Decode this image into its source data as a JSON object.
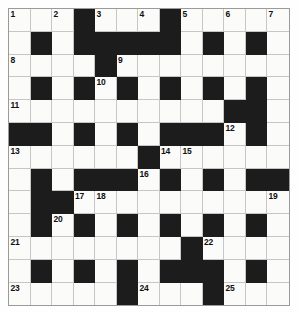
{
  "puzzle": {
    "title": "Crossword Grid",
    "rows": 13,
    "cols": 13,
    "cell_size_px": 21.5,
    "colors": {
      "blocked": "#1c1c1c",
      "open": "#fbfbfa",
      "gridline": "#c6c6c6",
      "border": "#9a9a9a",
      "number_text": "#101010",
      "page_background": "#ffffff"
    },
    "blocked_cells": [
      [
        0,
        3
      ],
      [
        0,
        7
      ],
      [
        1,
        1
      ],
      [
        1,
        3
      ],
      [
        1,
        4
      ],
      [
        1,
        5
      ],
      [
        1,
        6
      ],
      [
        1,
        7
      ],
      [
        1,
        9
      ],
      [
        1,
        11
      ],
      [
        2,
        4
      ],
      [
        3,
        1
      ],
      [
        3,
        3
      ],
      [
        3,
        5
      ],
      [
        3,
        7
      ],
      [
        3,
        9
      ],
      [
        3,
        11
      ],
      [
        4,
        10
      ],
      [
        4,
        11
      ],
      [
        5,
        0
      ],
      [
        5,
        1
      ],
      [
        5,
        3
      ],
      [
        5,
        5
      ],
      [
        5,
        7
      ],
      [
        5,
        8
      ],
      [
        5,
        9
      ],
      [
        5,
        11
      ],
      [
        6,
        6
      ],
      [
        7,
        1
      ],
      [
        7,
        3
      ],
      [
        7,
        4
      ],
      [
        7,
        5
      ],
      [
        7,
        7
      ],
      [
        7,
        9
      ],
      [
        7,
        11
      ],
      [
        7,
        12
      ],
      [
        8,
        1
      ],
      [
        8,
        2
      ],
      [
        9,
        1
      ],
      [
        9,
        3
      ],
      [
        9,
        5
      ],
      [
        9,
        7
      ],
      [
        9,
        9
      ],
      [
        9,
        11
      ],
      [
        10,
        8
      ],
      [
        11,
        1
      ],
      [
        11,
        3
      ],
      [
        11,
        5
      ],
      [
        11,
        7
      ],
      [
        11,
        8
      ],
      [
        11,
        9
      ],
      [
        11,
        11
      ],
      [
        12,
        5
      ],
      [
        12,
        9
      ]
    ],
    "numbers": [
      {
        "n": 1,
        "row": 0,
        "col": 0
      },
      {
        "n": 2,
        "row": 0,
        "col": 2
      },
      {
        "n": 3,
        "row": 0,
        "col": 4
      },
      {
        "n": 4,
        "row": 0,
        "col": 6
      },
      {
        "n": 5,
        "row": 0,
        "col": 8
      },
      {
        "n": 6,
        "row": 0,
        "col": 10
      },
      {
        "n": 7,
        "row": 0,
        "col": 12
      },
      {
        "n": 8,
        "row": 2,
        "col": 0
      },
      {
        "n": 9,
        "row": 2,
        "col": 5
      },
      {
        "n": 10,
        "row": 3,
        "col": 4
      },
      {
        "n": 11,
        "row": 4,
        "col": 0
      },
      {
        "n": 12,
        "row": 5,
        "col": 10
      },
      {
        "n": 13,
        "row": 6,
        "col": 0
      },
      {
        "n": 14,
        "row": 6,
        "col": 7
      },
      {
        "n": 15,
        "row": 6,
        "col": 8
      },
      {
        "n": 16,
        "row": 7,
        "col": 6
      },
      {
        "n": 17,
        "row": 8,
        "col": 3
      },
      {
        "n": 18,
        "row": 8,
        "col": 4
      },
      {
        "n": 19,
        "row": 8,
        "col": 12
      },
      {
        "n": 20,
        "row": 9,
        "col": 2
      },
      {
        "n": 21,
        "row": 10,
        "col": 0
      },
      {
        "n": 22,
        "row": 10,
        "col": 9
      },
      {
        "n": 23,
        "row": 12,
        "col": 0
      },
      {
        "n": 24,
        "row": 12,
        "col": 6
      },
      {
        "n": 25,
        "row": 12,
        "col": 10
      }
    ],
    "letters": []
  }
}
